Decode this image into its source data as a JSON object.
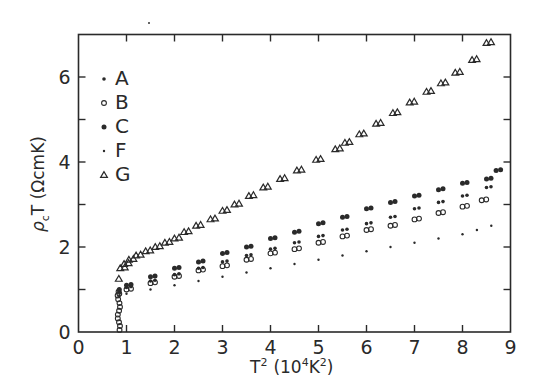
{
  "chart_data": {
    "type": "scatter",
    "title": "",
    "xlabel": "T² (10⁴K²)",
    "ylabel": "ρcT (ΩcmK)",
    "xlim": [
      0,
      9
    ],
    "ylim": [
      0,
      7
    ],
    "xticks": [
      0,
      1,
      2,
      3,
      4,
      5,
      6,
      7,
      8,
      9
    ],
    "yticks_labeled": [
      0,
      2,
      4,
      6
    ],
    "yticks_minor": [
      1,
      3,
      5
    ],
    "grid": false,
    "legend_position": "upper-left",
    "series": [
      {
        "name": "A",
        "marker": "small-filled-dot",
        "x": [
          0.85,
          1.0,
          1.5,
          2.0,
          2.5,
          3.0,
          3.5,
          4.0,
          4.5,
          5.0,
          5.5,
          6.0,
          6.5,
          7.0,
          7.5,
          8.0,
          8.5
        ],
        "y": [
          0.95,
          1.05,
          1.2,
          1.35,
          1.5,
          1.65,
          1.8,
          1.95,
          2.1,
          2.25,
          2.4,
          2.55,
          2.7,
          2.9,
          3.05,
          3.2,
          3.4
        ]
      },
      {
        "name": "B",
        "marker": "open-circle",
        "x": [
          0.85,
          1.0,
          1.5,
          2.0,
          2.5,
          3.0,
          3.5,
          4.0,
          4.5,
          5.0,
          5.5,
          6.0,
          6.5,
          7.0,
          7.5,
          8.0,
          8.4
        ],
        "y": [
          0.9,
          1.0,
          1.15,
          1.3,
          1.45,
          1.55,
          1.7,
          1.85,
          1.95,
          2.1,
          2.25,
          2.4,
          2.5,
          2.65,
          2.8,
          2.95,
          3.1
        ]
      },
      {
        "name": "C",
        "marker": "large-filled-dot",
        "x": [
          0.85,
          1.0,
          1.5,
          2.0,
          2.5,
          3.0,
          3.5,
          4.0,
          4.5,
          5.0,
          5.5,
          6.0,
          6.5,
          7.0,
          7.5,
          8.0,
          8.5,
          8.7
        ],
        "y": [
          1.0,
          1.1,
          1.3,
          1.5,
          1.65,
          1.85,
          2.0,
          2.2,
          2.35,
          2.55,
          2.7,
          2.9,
          3.05,
          3.2,
          3.35,
          3.5,
          3.6,
          3.8
        ]
      },
      {
        "name": "F",
        "marker": "tiny-dot",
        "x": [
          0.85,
          1.0,
          1.5,
          2.0,
          2.5,
          3.0,
          3.5,
          4.0,
          4.5,
          5.0,
          5.5,
          6.0,
          6.5,
          7.0,
          7.5,
          8.0,
          8.3,
          8.6
        ],
        "y": [
          0.85,
          0.9,
          1.0,
          1.1,
          1.2,
          1.3,
          1.4,
          1.5,
          1.6,
          1.7,
          1.8,
          1.9,
          2.0,
          2.1,
          2.2,
          2.3,
          2.4,
          2.5
        ]
      },
      {
        "name": "G",
        "marker": "open-triangle",
        "x": [
          0.84,
          0.87,
          0.95,
          1.05,
          1.2,
          1.4,
          1.6,
          1.8,
          2.0,
          2.2,
          2.45,
          2.75,
          3.0,
          3.25,
          3.55,
          3.85,
          4.2,
          4.55,
          4.95,
          5.35,
          5.55,
          5.85,
          6.2,
          6.55,
          6.9,
          7.25,
          7.55,
          7.85,
          8.2,
          8.5
        ],
        "y": [
          1.25,
          1.5,
          1.6,
          1.7,
          1.8,
          1.9,
          2.0,
          2.1,
          2.2,
          2.35,
          2.5,
          2.65,
          2.85,
          3.0,
          3.2,
          3.4,
          3.6,
          3.8,
          4.05,
          4.3,
          4.45,
          4.65,
          4.9,
          5.15,
          5.4,
          5.65,
          5.85,
          6.1,
          6.4,
          6.8
        ]
      }
    ],
    "low_temperature_drop": {
      "x": 0.84,
      "y_range": [
        0,
        1.0
      ],
      "note": "All series drop vertically to 0 near T² ≈ 0.84"
    }
  },
  "legend": [
    {
      "label": "A",
      "marker": "small-filled-dot"
    },
    {
      "label": "B",
      "marker": "open-circle"
    },
    {
      "label": "C",
      "marker": "large-filled-dot"
    },
    {
      "label": "F",
      "marker": "tiny-dot"
    },
    {
      "label": "G",
      "marker": "open-triangle"
    }
  ],
  "axes": {
    "x_title_main": "T",
    "x_title_sup": "2",
    "x_title_units": "(10",
    "x_title_units_sup": "4",
    "x_title_units_tail": "K",
    "x_title_units_tail_sup": "2",
    "x_title_close": ")",
    "y_title_rho": "ρ",
    "y_title_sub": "c",
    "y_title_rest": "T (ΩcmK)"
  }
}
